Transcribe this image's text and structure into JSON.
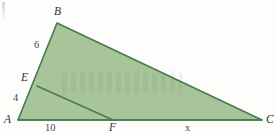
{
  "figure": {
    "colors": {
      "fill": "#a8c49a",
      "stroke": "#4a7a4a",
      "inner_stroke": "#4a7a4a",
      "background": "#fdfdfc",
      "label_color": "#3a3a38"
    },
    "vertices": {
      "A": {
        "label": "A",
        "x": 18,
        "y": 120
      },
      "B": {
        "label": "B",
        "x": 57,
        "y": 23
      },
      "C": {
        "label": "C",
        "x": 262,
        "y": 120
      },
      "E": {
        "label": "E",
        "x": 37,
        "y": 86
      },
      "F": {
        "label": "F",
        "x": 113,
        "y": 120
      }
    },
    "segments": [
      {
        "name": "AB",
        "from": "A",
        "to": "B"
      },
      {
        "name": "BC",
        "from": "B",
        "to": "C"
      },
      {
        "name": "AC",
        "from": "A",
        "to": "C"
      },
      {
        "name": "EF",
        "from": "E",
        "to": "F"
      }
    ],
    "labels": [
      {
        "id": "vertex-b",
        "text": "B",
        "kind": "vertex",
        "left": 54,
        "top": 6
      },
      {
        "id": "side-eb",
        "text": "6",
        "kind": "measure",
        "left": 34,
        "top": 40
      },
      {
        "id": "vertex-e",
        "text": "E",
        "kind": "vertex",
        "left": 21,
        "top": 72
      },
      {
        "id": "side-ae",
        "text": "4",
        "kind": "measure",
        "left": 13,
        "top": 93
      },
      {
        "id": "vertex-a",
        "text": "A",
        "kind": "vertex",
        "left": 4,
        "top": 114
      },
      {
        "id": "side-af",
        "text": "10",
        "kind": "measure",
        "left": 45,
        "top": 123
      },
      {
        "id": "vertex-f",
        "text": "F",
        "kind": "vertex",
        "left": 109,
        "top": 122
      },
      {
        "id": "side-fc",
        "text": "x",
        "kind": "measure",
        "left": 185,
        "top": 123
      },
      {
        "id": "vertex-c",
        "text": "C",
        "kind": "vertex",
        "left": 266,
        "top": 114
      }
    ],
    "measures": {
      "EB": "6",
      "AE": "4",
      "AF": "10",
      "FC": "x"
    }
  }
}
